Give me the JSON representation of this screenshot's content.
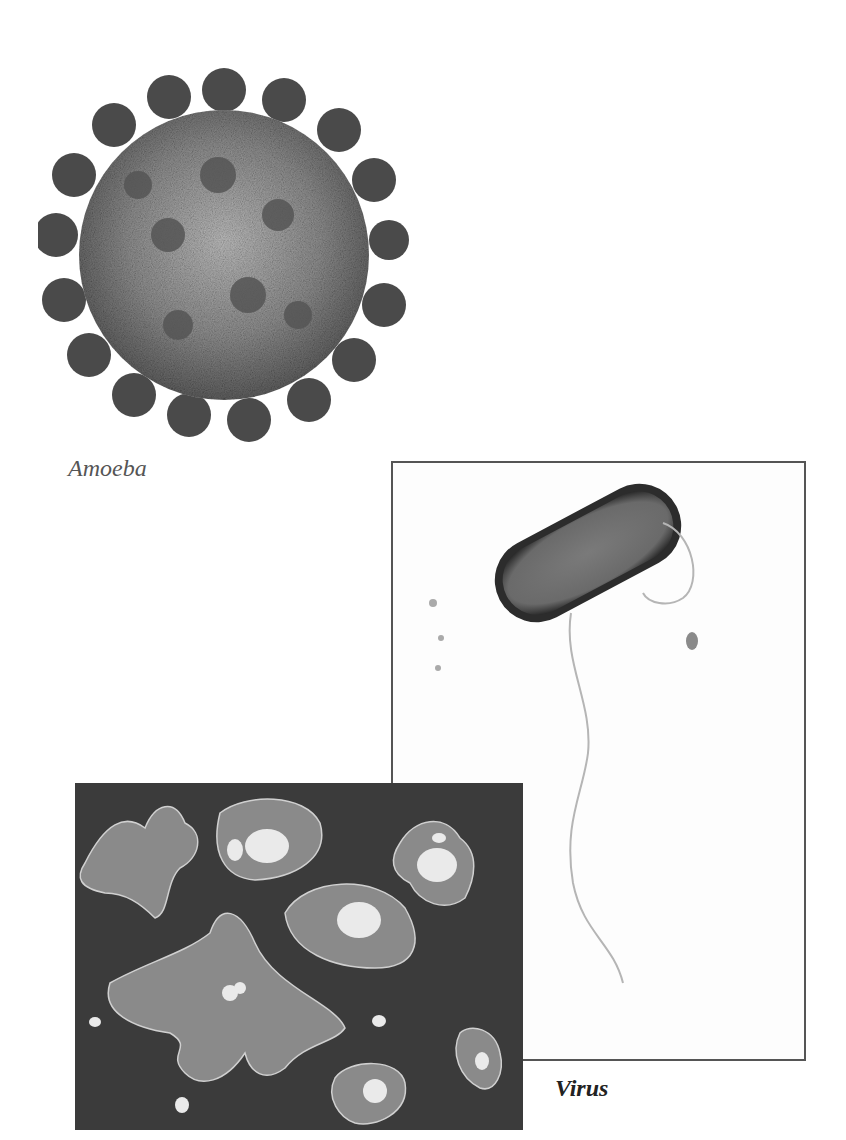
{
  "figure": {
    "images": [
      {
        "id": "spiky-sphere",
        "description": "Grayscale rendering of a spherical virus particle with protruding spike proteins"
      },
      {
        "id": "rod-bacterium",
        "description": "Grayscale micrograph of a rod-shaped bacterium with a single flagellum, in a bordered frame"
      },
      {
        "id": "amoeba-cells",
        "description": "Dark-field grayscale image of several amoeba cells with visible nuclei"
      }
    ],
    "labels": {
      "label_1": "Amoeba",
      "label_2": "Virus"
    }
  }
}
